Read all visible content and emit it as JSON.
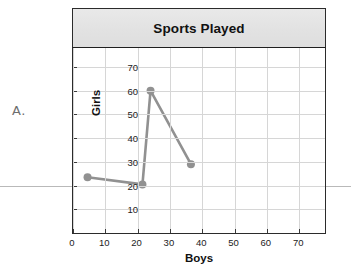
{
  "item_label": "A.",
  "chart": {
    "title": "Sports Played",
    "xlabel": "Boys",
    "ylabel": "Girls"
  },
  "chart_data": {
    "type": "line",
    "title": "Sports Played",
    "xlabel": "Boys",
    "ylabel": "Girls",
    "xlim": [
      0,
      78
    ],
    "ylim": [
      0,
      78
    ],
    "xticks": [
      0,
      10,
      20,
      30,
      40,
      50,
      60,
      70
    ],
    "yticks": [
      10,
      20,
      30,
      40,
      50,
      60,
      70
    ],
    "grid": true,
    "legend": "none",
    "markers": "circle",
    "series": [
      {
        "name": "Sports Played",
        "color": "#919191",
        "points": [
          {
            "x": 4.5,
            "y": 23.5
          },
          {
            "x": 21.5,
            "y": 20.5
          },
          {
            "x": 24.0,
            "y": 60.0
          },
          {
            "x": 36.5,
            "y": 29.0
          }
        ]
      }
    ]
  },
  "colors": {
    "series": "#919191",
    "grid": "#d6d6d6",
    "frame": "#2b2b2b",
    "title_band": "#e2e2e2",
    "page_rule": "#b9b9b9"
  }
}
